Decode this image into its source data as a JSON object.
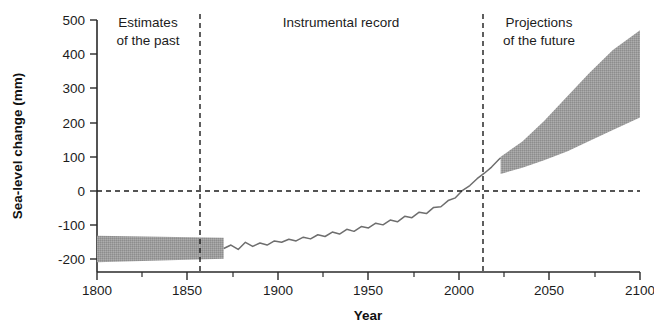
{
  "chart_data": {
    "type": "area",
    "title": "",
    "xlabel": "Year",
    "ylabel": "Sea-level change (mm)",
    "xlim": [
      1800,
      2100
    ],
    "ylim": [
      -250,
      520
    ],
    "grid": false,
    "legend_position": "none",
    "x_ticks": [
      1800,
      1850,
      1900,
      1950,
      2000,
      2050,
      2100
    ],
    "x_tick_labels": [
      "1800",
      "1850",
      "1900",
      "1950",
      "2000",
      "2050",
      "2100"
    ],
    "x_minor_ticks": [
      1825,
      1875,
      1925,
      1975,
      2025,
      2075
    ],
    "y_ticks": [
      -200,
      -100,
      0,
      100,
      200,
      300,
      400,
      500
    ],
    "y_tick_labels": [
      "-200",
      "-100",
      "0",
      "100",
      "200",
      "300",
      "400",
      "500"
    ],
    "zero_reference_line": 0,
    "panel_dividers": [
      1870,
      2023
    ],
    "annotations": [
      {
        "text": "Estimates of the past",
        "x": 1835,
        "y": 470
      },
      {
        "text": "Instrumental record",
        "x": 1947,
        "y": 480
      },
      {
        "text": "Projections of the future",
        "x": 2062,
        "y": 470
      }
    ],
    "series": [
      {
        "name": "Estimates of the past (uncertainty band)",
        "type": "band",
        "color": "#999999",
        "x": [
          1800,
          1870
        ],
        "upper": [
          -131,
          -137
        ],
        "lower": [
          -208,
          -198
        ]
      },
      {
        "name": "Instrumental record (tide gauge / satellite)",
        "type": "line",
        "color": "#6e6e6e",
        "x": [
          1870,
          1874,
          1878,
          1882,
          1886,
          1890,
          1894,
          1898,
          1902,
          1906,
          1910,
          1914,
          1918,
          1922,
          1926,
          1930,
          1934,
          1938,
          1942,
          1946,
          1950,
          1954,
          1958,
          1962,
          1966,
          1970,
          1974,
          1978,
          1982,
          1986,
          1990,
          1994,
          1998,
          2002,
          2006,
          2010,
          2014,
          2018,
          2022,
          2023
        ],
        "y": [
          -168,
          -158,
          -171,
          -150,
          -162,
          -152,
          -158,
          -146,
          -150,
          -141,
          -146,
          -135,
          -140,
          -128,
          -133,
          -120,
          -126,
          -112,
          -118,
          -104,
          -108,
          -94,
          -99,
          -85,
          -90,
          -74,
          -78,
          -62,
          -66,
          -48,
          -46,
          -28,
          -20,
          2,
          16,
          36,
          52,
          70,
          92,
          97
        ]
      },
      {
        "name": "Projections of the future (range)",
        "type": "band",
        "color": "#999999",
        "x": [
          2023,
          2035,
          2047,
          2060,
          2072,
          2085,
          2100
        ],
        "upper": [
          100,
          145,
          205,
          278,
          345,
          412,
          470
        ],
        "lower": [
          50,
          68,
          90,
          116,
          146,
          178,
          215
        ]
      }
    ]
  },
  "axes": {
    "y_title": "Sea-level change (mm)",
    "x_title": "Year"
  },
  "panels": {
    "left": {
      "line1": "Estimates",
      "line2": "of the past"
    },
    "middle": {
      "line1": "Instrumental record"
    },
    "right": {
      "line1": "Projections",
      "line2": "of the future"
    }
  },
  "y_tick_labels": [
    "500",
    "400",
    "300",
    "200",
    "100",
    "0",
    "-100",
    "-200"
  ],
  "x_tick_labels": [
    "1800",
    "1850",
    "1900",
    "1950",
    "2000",
    "2050",
    "2100"
  ],
  "colors": {
    "band": "#999999",
    "line": "#6e6e6e",
    "axis": "#2a2a2a",
    "text": "#1c1c1c"
  }
}
